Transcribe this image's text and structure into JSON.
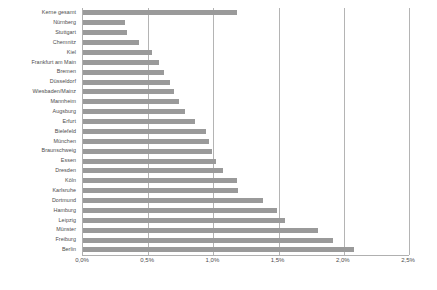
{
  "chart_data": {
    "type": "bar",
    "orientation": "horizontal",
    "title": "",
    "xlabel": "",
    "ylabel": "",
    "xlim": [
      0,
      2.5
    ],
    "xticks": [
      0,
      0.5,
      1.0,
      1.5,
      2.0,
      2.5
    ],
    "xtick_labels": [
      "0,0%",
      "0,5%",
      "1,0%",
      "1,5%",
      "2,0%",
      "2,5%"
    ],
    "grid": true,
    "legend": false,
    "value_unit": "%",
    "bar_color": "#9a9a9a",
    "axis_color": "#b0b0b0",
    "gridline_color": "#b4b4b4",
    "categories": [
      "Kerne gesamt",
      "Nürnberg",
      "Stuttgart",
      "Chemnitz",
      "Kiel",
      "Frankfurt am Main",
      "Bremen",
      "Düsseldorf",
      "Wiesbaden/Mainz",
      "Mannheim",
      "Augsburg",
      "Erfurt",
      "Bielefeld",
      "München",
      "Braunschweig",
      "Essen",
      "Dresden",
      "Köln",
      "Karlsruhe",
      "Dortmund",
      "Hamburg",
      "Leipzig",
      "Münster",
      "Freiburg",
      "Berlin"
    ],
    "values": [
      1.18,
      0.32,
      0.34,
      0.43,
      0.53,
      0.58,
      0.62,
      0.67,
      0.7,
      0.74,
      0.78,
      0.86,
      0.94,
      0.97,
      0.99,
      1.02,
      1.07,
      1.18,
      1.19,
      1.38,
      1.49,
      1.55,
      1.8,
      1.92,
      2.08
    ]
  }
}
